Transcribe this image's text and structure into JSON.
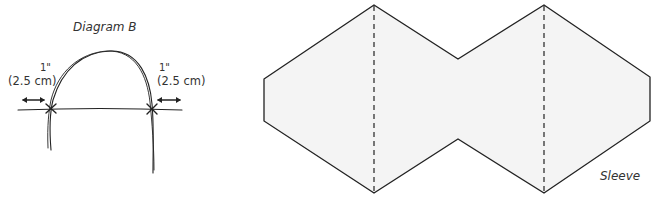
{
  "diagram_b": {
    "title": "Diagram B",
    "left_measure": {
      "inches": "1\"",
      "metric": "(2.5 cm)"
    },
    "right_measure": {
      "inches": "1\"",
      "metric": "(2.5 cm)"
    },
    "colors": {
      "stroke": "#222222"
    }
  },
  "sleeve": {
    "label": "Sleeve",
    "colors": {
      "fill": "#f4f4f4",
      "stroke": "#222222",
      "fold_line": "#222222"
    },
    "outline_points": [
      [
        264,
        79
      ],
      [
        374,
        5
      ],
      [
        458,
        59
      ],
      [
        544,
        5
      ],
      [
        650,
        77
      ],
      [
        650,
        121
      ],
      [
        544,
        193
      ],
      [
        458,
        139
      ],
      [
        374,
        193
      ],
      [
        264,
        121
      ]
    ],
    "fold_lines": [
      {
        "x": 374,
        "y1": 5,
        "y2": 193
      },
      {
        "x": 544,
        "y1": 5,
        "y2": 193
      }
    ]
  }
}
